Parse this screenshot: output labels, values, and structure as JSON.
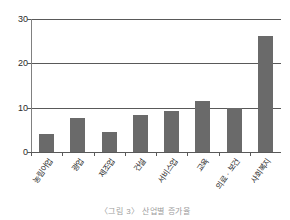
{
  "chart_data": {
    "type": "bar",
    "title": "",
    "subtitle": "",
    "xlabel": "",
    "ylabel": "",
    "ylim": [
      0,
      30
    ],
    "yticks": [
      0,
      10,
      20,
      30
    ],
    "ytick_labels": [
      "0",
      "10",
      "20",
      "30"
    ],
    "grid": true,
    "grid_axis": "y",
    "legend": false,
    "legend_position": "none",
    "categories": [
      "농림어업",
      "광업",
      "제조업",
      "건설",
      "서비스업",
      "교육",
      "의료 · 보건",
      "사회복지"
    ],
    "values": [
      4.1,
      7.7,
      4.5,
      8.4,
      9.3,
      11.5,
      10.0,
      26.2
    ],
    "bar_color": "#6a6a6a",
    "axis_color": "#595959",
    "gridline_color": "#595959",
    "text_color": "#2b2b2b",
    "background": "#ffffff"
  },
  "caption": {
    "text": "〈그림 3〉 산업별 증가율"
  }
}
